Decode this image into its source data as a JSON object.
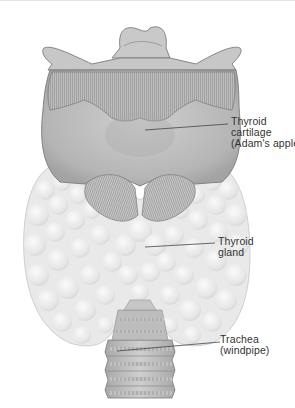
{
  "figure": {
    "colors": {
      "background": "#ffffff",
      "cartilage": "#c4c4c4",
      "cartilage_dark": "#9a9a9a",
      "gland": "#eaeaea",
      "trachea": "#b8b8b8",
      "leader_line": "#444444",
      "label_text": "#333333"
    },
    "labels": [
      {
        "id": "thyroid-cartilage",
        "lines": [
          "Thyroid",
          "cartilage",
          "(Adam's apple)"
        ]
      },
      {
        "id": "thyroid-gland",
        "lines": [
          "Thyroid",
          "gland"
        ]
      },
      {
        "id": "trachea",
        "lines": [
          "Trachea",
          "(windpipe)"
        ]
      }
    ]
  }
}
